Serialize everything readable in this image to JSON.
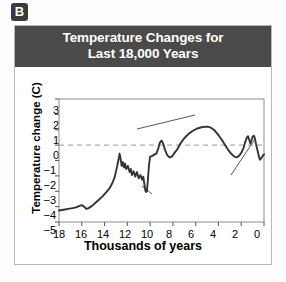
{
  "panel": {
    "label": "B"
  },
  "title": {
    "line1": "Temperature Changes for",
    "line2": "Last 18,000 Years"
  },
  "colors": {
    "banner_bg": "#4a4a4a",
    "banner_text": "#ffffff",
    "badge_bg": "#3b3b3b",
    "plot_line": "#333333",
    "frame": "#888888",
    "zero_line": "#999999",
    "card_border": "#b9b9b9"
  },
  "chart_data": {
    "type": "line",
    "title": "Temperature Changes for Last 18,000 Years",
    "xlabel": "Thousands of years",
    "ylabel": "Temperature change (C)",
    "xlim": [
      18,
      0
    ],
    "ylim": [
      -5,
      3
    ],
    "x_ticks": [
      "18",
      "16",
      "14",
      "12",
      "10",
      "8",
      "6",
      "4",
      "2",
      "0"
    ],
    "x_tick_values": [
      18,
      16,
      14,
      12,
      10,
      8,
      6,
      4,
      2,
      0
    ],
    "y_ticks": [
      "3",
      "2",
      "1",
      "0",
      "−1",
      "−2",
      "−3",
      "−4",
      "−5"
    ],
    "y_tick_values": [
      3,
      2,
      1,
      0,
      -1,
      -2,
      -3,
      -4,
      -5
    ],
    "x_axis_reversed": true,
    "grid": false,
    "legend": "none",
    "reference_lines": [
      {
        "name": "zero-line",
        "axis": "y",
        "value": 0,
        "style": "dashed"
      }
    ],
    "series": [
      {
        "name": "Temperature change",
        "points": [
          [
            18.0,
            -4.25
          ],
          [
            17.6,
            -4.2
          ],
          [
            17.2,
            -4.15
          ],
          [
            16.8,
            -4.1
          ],
          [
            16.5,
            -4.05
          ],
          [
            16.2,
            -3.95
          ],
          [
            16.0,
            -3.9
          ],
          [
            15.8,
            -4.0
          ],
          [
            15.6,
            -4.15
          ],
          [
            15.4,
            -4.1
          ],
          [
            15.1,
            -3.95
          ],
          [
            14.8,
            -3.75
          ],
          [
            14.5,
            -3.55
          ],
          [
            14.2,
            -3.35
          ],
          [
            13.9,
            -3.1
          ],
          [
            13.6,
            -2.85
          ],
          [
            13.3,
            -2.45
          ],
          [
            13.1,
            -2.05
          ],
          [
            12.9,
            -1.4
          ],
          [
            12.75,
            -0.85
          ],
          [
            12.68,
            -0.55
          ],
          [
            12.6,
            -0.85
          ],
          [
            12.5,
            -1.35
          ],
          [
            12.4,
            -1.1
          ],
          [
            12.3,
            -1.45
          ],
          [
            12.2,
            -1.2
          ],
          [
            12.1,
            -1.55
          ],
          [
            11.95,
            -1.35
          ],
          [
            11.8,
            -1.75
          ],
          [
            11.7,
            -1.55
          ],
          [
            11.6,
            -1.95
          ],
          [
            11.45,
            -1.7
          ],
          [
            11.3,
            -2.05
          ],
          [
            11.15,
            -1.75
          ],
          [
            11.0,
            -2.15
          ],
          [
            10.85,
            -1.95
          ],
          [
            10.7,
            -2.25
          ],
          [
            10.6,
            -2.05
          ],
          [
            10.5,
            -2.55
          ],
          [
            10.42,
            -2.95
          ],
          [
            10.35,
            -3.05
          ],
          [
            10.3,
            -2.85
          ],
          [
            10.28,
            -3.0
          ],
          [
            10.2,
            -2.3
          ],
          [
            10.1,
            -1.3
          ],
          [
            10.0,
            -0.75
          ],
          [
            9.8,
            -0.7
          ],
          [
            9.6,
            -0.6
          ],
          [
            9.45,
            -0.55
          ],
          [
            9.3,
            -0.25
          ],
          [
            9.15,
            0.15
          ],
          [
            9.0,
            0.3
          ],
          [
            8.85,
            0.1
          ],
          [
            8.7,
            -0.3
          ],
          [
            8.5,
            -0.65
          ],
          [
            8.3,
            -0.8
          ],
          [
            8.1,
            -0.75
          ],
          [
            7.9,
            -0.55
          ],
          [
            7.6,
            -0.25
          ],
          [
            7.3,
            0.15
          ],
          [
            7.0,
            0.45
          ],
          [
            6.6,
            0.75
          ],
          [
            6.2,
            0.95
          ],
          [
            5.8,
            1.1
          ],
          [
            5.4,
            1.18
          ],
          [
            5.0,
            1.2
          ],
          [
            4.7,
            1.15
          ],
          [
            4.4,
            1.0
          ],
          [
            4.1,
            0.75
          ],
          [
            3.8,
            0.45
          ],
          [
            3.5,
            0.1
          ],
          [
            3.2,
            -0.25
          ],
          [
            2.9,
            -0.55
          ],
          [
            2.6,
            -0.75
          ],
          [
            2.4,
            -0.8
          ],
          [
            2.2,
            -0.7
          ],
          [
            2.0,
            -0.5
          ],
          [
            1.8,
            -0.2
          ],
          [
            1.65,
            0.2
          ],
          [
            1.5,
            0.5
          ],
          [
            1.4,
            0.58
          ],
          [
            1.3,
            0.35
          ],
          [
            1.2,
            0.1
          ],
          [
            1.1,
            0.3
          ],
          [
            1.0,
            0.55
          ],
          [
            0.9,
            0.62
          ],
          [
            0.8,
            0.45
          ],
          [
            0.7,
            0.05
          ],
          [
            0.55,
            -0.4
          ],
          [
            0.45,
            -0.75
          ],
          [
            0.35,
            -0.95
          ],
          [
            0.25,
            -0.85
          ],
          [
            0.12,
            -0.7
          ],
          [
            0.0,
            -0.6
          ]
        ]
      }
    ],
    "annotations": [
      {
        "name": "holocene-maximum",
        "line1": "Holocene",
        "line2": "maximum",
        "points_to_x": 6.0,
        "points_to_y": 1.05
      },
      {
        "name": "medieval-climatic-optimum",
        "line1": "Medieval climatic",
        "line2": "optimum",
        "points_to_x": 5.0,
        "points_to_y": 1.2
      },
      {
        "name": "younger-dryas",
        "line1": "Younger-",
        "line2": "Dryas",
        "points_to_x": 10.3,
        "points_to_y": -3.0
      },
      {
        "name": "little-ice-age",
        "line1": "Little Ice",
        "line2": "Age",
        "points_to_x": 0.4,
        "points_to_y": -0.9
      }
    ]
  }
}
